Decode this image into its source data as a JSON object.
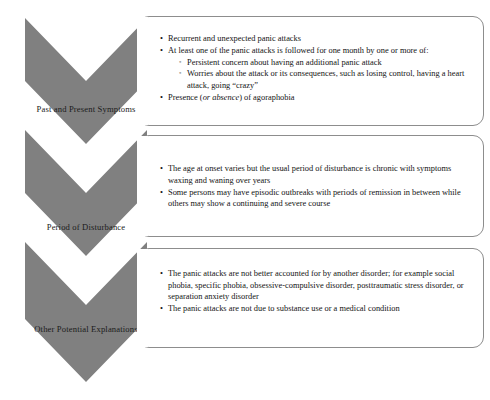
{
  "diagram": {
    "accent_gray": "#808080",
    "box_border": "#8d8d8d",
    "text_color": "#131313",
    "stages": [
      {
        "label": "Past and Present Symptoms",
        "bullets": [
          {
            "text": "Recurrent and unexpected panic attacks",
            "marker": "filled-bullet"
          },
          {
            "text": "At least one of the panic attacks is followed for one month by one or more of:",
            "marker": "filled-bullet",
            "sub": [
              {
                "text": "Persistent concern about having an additional panic attack",
                "marker": "hollow-bullet"
              },
              {
                "text": "Worries about the attack or its consequences, such as losing control, having a heart attack, going “crazy”",
                "marker": "hollow-bullet"
              }
            ]
          },
          {
            "text_before": "Presence (",
            "text_italic": "or absence",
            "text_after": ") of agoraphobia",
            "marker": "filled-bullet"
          }
        ]
      },
      {
        "label": "Period of Disturbance",
        "bullets": [
          {
            "text": "The age at onset varies but the usual period of disturbance is chronic with symptoms waxing and waning over years",
            "marker": "filled-bullet"
          },
          {
            "text": "Some persons may have episodic outbreaks with periods of remission in between while others may show a continuing and severe course",
            "marker": "filled-bullet"
          }
        ]
      },
      {
        "label": "Other Potential Explanations",
        "bullets": [
          {
            "text": "The panic attacks are not better accounted for by another disorder; for example social phobia, specific phobia, obsessive-compulsive disorder, posttraumatic stress disorder, or separation anxiety disorder",
            "marker": "filled-bullet"
          },
          {
            "text": "The panic attacks are not due to substance use or a medical condition",
            "marker": "filled-bullet"
          }
        ]
      }
    ],
    "markers": {
      "filled-bullet": "•",
      "hollow-bullet": "◦"
    }
  }
}
